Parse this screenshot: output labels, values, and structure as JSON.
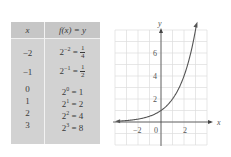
{
  "table": {
    "headers": [
      "x",
      "f(x) = y"
    ],
    "rows": [
      {
        "x": "−2",
        "base": "2",
        "exp": "−2",
        "eq": " = ",
        "val_num": "1",
        "val_den": "4",
        "val": ""
      },
      {
        "x": "−1",
        "base": "2",
        "exp": "−1",
        "eq": " = ",
        "val_num": "1",
        "val_den": "2",
        "val": ""
      },
      {
        "x": "0",
        "base": "2",
        "exp": "0",
        "eq": " = ",
        "val": "1"
      },
      {
        "x": "1",
        "base": "2",
        "exp": "1",
        "eq": " = ",
        "val": "2"
      },
      {
        "x": "2",
        "base": "2",
        "exp": "2",
        "eq": " = ",
        "val": "4"
      },
      {
        "x": "3",
        "base": "2",
        "exp": "3",
        "eq": " = ",
        "val": "8"
      }
    ]
  },
  "chart_data": {
    "type": "line",
    "title": "",
    "function": "f(x) = 2^x",
    "xlabel": "x",
    "ylabel": "y",
    "x_ticks": [
      "−2",
      "0",
      "2"
    ],
    "y_ticks": [
      "2",
      "4",
      "6"
    ],
    "xlim": [
      -4,
      4
    ],
    "ylim": [
      -2,
      8
    ],
    "grid": true,
    "series": [
      {
        "name": "y = 2^x",
        "x": [
          -3.7,
          -3,
          -2,
          -1,
          0,
          1,
          2,
          3,
          3.1
        ],
        "y": [
          0.077,
          0.125,
          0.25,
          0.5,
          1,
          2,
          4,
          8,
          8.57
        ]
      }
    ],
    "table_points": {
      "x": [
        -2,
        -1,
        0,
        1,
        2,
        3
      ],
      "y": [
        0.25,
        0.5,
        1,
        2,
        4,
        8
      ]
    }
  },
  "colors": {
    "table_bg": "#d2d2d2",
    "header_bg": "#c6c6c6",
    "grid": "#dcdcdc",
    "axis": "#444444",
    "curve": "#555555"
  }
}
